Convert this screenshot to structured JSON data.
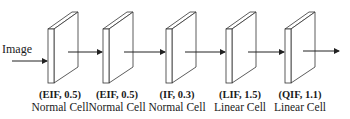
{
  "input_label": "Image",
  "cells": [
    {
      "type": "(EIF, 0.5)",
      "name": "Normal Cell"
    },
    {
      "type": "(EIF, 0.5)",
      "name": "Normal Cell"
    },
    {
      "type": "(IF, 0.3)",
      "name": "Normal Cell"
    },
    {
      "type": "(LIF, 1.5)",
      "name": "Linear Cell"
    },
    {
      "type": "(QIF, 1.1)",
      "name": "Linear Cell"
    }
  ],
  "colors": {
    "stroke": "#333333",
    "fill": "#ffffff"
  }
}
